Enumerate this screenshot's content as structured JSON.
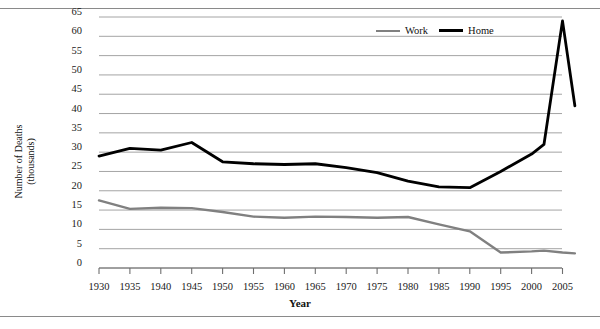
{
  "chart_data": {
    "type": "line",
    "title": "",
    "xlabel": "Year",
    "ylabel": "Number of Deaths (thousands)",
    "xlim": [
      1928,
      2008
    ],
    "ylim": [
      0,
      65
    ],
    "ytick_step": 5,
    "grid": true,
    "legend_position": "top-right",
    "xticks": [
      1930,
      1935,
      1940,
      1945,
      1950,
      1955,
      1960,
      1965,
      1970,
      1975,
      1980,
      1985,
      1990,
      1995,
      2000,
      2005
    ],
    "yticks": [
      0,
      5,
      10,
      15,
      20,
      25,
      30,
      35,
      40,
      45,
      50,
      55,
      60,
      65
    ],
    "x": [
      1930,
      1935,
      1940,
      1945,
      1950,
      1955,
      1960,
      1965,
      1970,
      1975,
      1980,
      1985,
      1990,
      1995,
      2000,
      2002,
      2005,
      2007
    ],
    "series": [
      {
        "name": "Work",
        "color": "#808080",
        "values": [
          17.5,
          15.3,
          15.6,
          15.5,
          14.5,
          13.3,
          13.0,
          13.3,
          13.2,
          13.0,
          13.2,
          11.3,
          9.5,
          4.0,
          4.3,
          4.5,
          4.0,
          3.8
        ]
      },
      {
        "name": "Home",
        "color": "#000000",
        "values": [
          29.0,
          31.0,
          30.5,
          32.5,
          27.5,
          27.0,
          26.8,
          27.0,
          26.0,
          24.7,
          22.5,
          21.0,
          20.8,
          25.0,
          29.5,
          32.0,
          64.0,
          42.0
        ]
      }
    ]
  },
  "axis": {
    "y_title_line1": "Number of Deaths",
    "y_title_line2": "(thousands)",
    "x_title": "Year"
  },
  "legend": {
    "items": [
      {
        "label": "Work"
      },
      {
        "label": "Home"
      }
    ]
  },
  "colors": {
    "work_line": "#808080",
    "home_line": "#000000",
    "gridline": "#9a9a9a",
    "axis": "#6f6f6f",
    "border": "#8a8a8a"
  }
}
